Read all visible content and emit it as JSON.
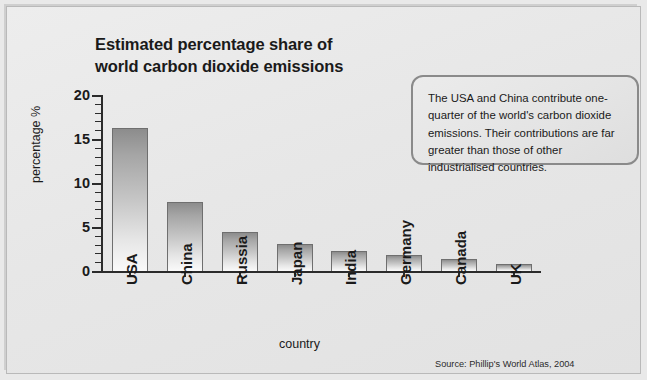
{
  "chart_data": {
    "type": "bar",
    "title": "Estimated percentage share of world carbon dioxide emissions",
    "title_line1": "Estimated percentage share of",
    "title_line2": "world carbon dioxide emissions",
    "categories": [
      "USA",
      "China",
      "Russia",
      "Japan",
      "India",
      "Germany",
      "Canada",
      "UK"
    ],
    "values": [
      16.3,
      7.8,
      4.4,
      3.1,
      2.3,
      1.8,
      1.4,
      0.8
    ],
    "xlabel": "country",
    "ylabel": "percentage %",
    "ylim": [
      0,
      20
    ],
    "ytick_labels": [
      "0",
      "5",
      "10",
      "15",
      "20"
    ],
    "ytick_values": [
      0,
      5,
      10,
      15,
      20
    ],
    "ytick_minor_step": 1,
    "grid": false,
    "legend": "none",
    "bar_color_top": "#8c8c8c",
    "bar_color_bottom": "#fafafa",
    "bar_border_color": "#6f6f6f",
    "axis_color": "#2b2b2b"
  },
  "callout": {
    "text": "The USA and China contribute one-quarter of the world's carbon dioxide emissions. Their contributions are far greater than those of other industrialised countries.",
    "border_color": "#8a8a8a"
  },
  "source": {
    "text": "Source: Phillip's World Atlas, 2004"
  },
  "page": {
    "background_color": "#e9e9e9",
    "frame_border_color": "#b9b9b9"
  }
}
